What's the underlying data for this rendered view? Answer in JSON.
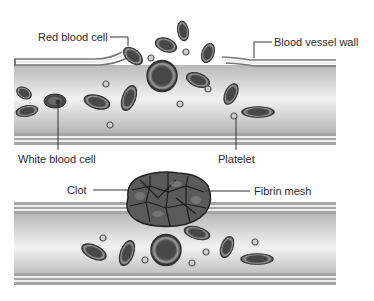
{
  "diagram": {
    "panels": [
      {
        "name": "normal-vessel",
        "description": "Blood flowing through an intact vessel"
      },
      {
        "name": "clotted-vessel",
        "description": "Clot formed over vessel injury"
      }
    ],
    "labels": {
      "red_blood_cell": "Red blood cell",
      "vessel_wall": "Blood  vessel wall",
      "white_blood_cell": "White blood cell",
      "platelet": "Platelet",
      "clot": "Clot",
      "fibrin_mesh": "Fibrin mesh"
    },
    "colors": {
      "cell_fill": "#4a4a4a",
      "cell_rim": "#8c8c8c",
      "vessel_wall": "#9a9a9a",
      "vessel_inner": "#d8d8d8",
      "label_text": "#2a2a2a"
    }
  }
}
